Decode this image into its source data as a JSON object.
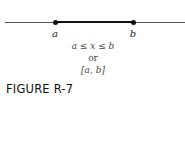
{
  "diagram": {
    "number_line": {
      "points": [
        {
          "label": "a",
          "x": 55
        },
        {
          "label": "b",
          "x": 133
        }
      ]
    },
    "notation": {
      "inequality": "a ≤ x ≤ b",
      "connector": "or",
      "interval": "[a, b]"
    },
    "caption": "FIGURE R-7"
  }
}
